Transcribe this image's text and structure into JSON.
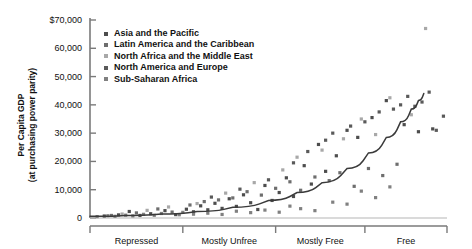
{
  "chart_data": {
    "type": "scatter",
    "title": "",
    "xlabel": "",
    "ylabel": "Per Capita GDP (at purchasing power parity)",
    "ylabel_line1": "Per Capita GDP",
    "ylabel_line2": "(at purchasing power parity)",
    "ylim": [
      0,
      70000
    ],
    "xlim": [
      0,
      100
    ],
    "grid": false,
    "legend_position": "top-left-inside",
    "y_ticks": [
      0,
      10000,
      20000,
      30000,
      40000,
      50000,
      60000,
      70000
    ],
    "y_tick_labels": [
      "0",
      "10,000",
      "20,000",
      "30,000",
      "40,000",
      "50,000",
      "60,000",
      "$70,000"
    ],
    "x_categories": [
      "Repressed",
      "Mostly Unfree",
      "Mostly Free",
      "Free"
    ],
    "x_category_bounds": [
      [
        0,
        26
      ],
      [
        26,
        52
      ],
      [
        52,
        77
      ],
      [
        77,
        100
      ]
    ],
    "x_tick_positions": [
      0,
      26,
      52,
      77,
      100
    ],
    "colors": {
      "asia_pacific": "#4d4d4d",
      "latin_america": "#6e6e6e",
      "north_africa_middle_east": "#a8a8a8",
      "north_america_europe": "#5a5a5a",
      "sub_saharan_africa": "#808080",
      "trend_line": "#3a3a3a",
      "axis": "#7a7a7a",
      "text": "#111111"
    },
    "series": [
      {
        "name": "Asia and the Pacific",
        "color": "#4d4d4d",
        "points": [
          [
            4,
            700
          ],
          [
            8,
            1100
          ],
          [
            11,
            2300
          ],
          [
            14,
            900
          ],
          [
            17,
            1500
          ],
          [
            21,
            2600
          ],
          [
            24,
            1200
          ],
          [
            27,
            3100
          ],
          [
            29,
            2200
          ],
          [
            31,
            4300
          ],
          [
            33,
            2900
          ],
          [
            35,
            5200
          ],
          [
            37,
            3400
          ],
          [
            39,
            6800
          ],
          [
            41,
            4100
          ],
          [
            43,
            8200
          ],
          [
            45,
            5400
          ],
          [
            47,
            3000
          ],
          [
            49,
            11500
          ],
          [
            51,
            6200
          ],
          [
            53,
            9000
          ],
          [
            55,
            14200
          ],
          [
            57,
            7600
          ],
          [
            60,
            18500
          ],
          [
            62,
            12000
          ],
          [
            64,
            26000
          ],
          [
            66,
            16500
          ],
          [
            69,
            22000
          ],
          [
            72,
            31000
          ],
          [
            75,
            28500
          ],
          [
            79,
            35500
          ],
          [
            83,
            41500
          ],
          [
            88,
            33000
          ],
          [
            92,
            30500
          ],
          [
            96,
            31500
          ]
        ]
      },
      {
        "name": "Latin America and the Caribbean",
        "color": "#6e6e6e",
        "points": [
          [
            6,
            900
          ],
          [
            13,
            1800
          ],
          [
            19,
            3200
          ],
          [
            23,
            2100
          ],
          [
            28,
            4600
          ],
          [
            32,
            5800
          ],
          [
            36,
            6400
          ],
          [
            40,
            7100
          ],
          [
            44,
            9300
          ],
          [
            48,
            8100
          ],
          [
            52,
            10500
          ],
          [
            56,
            12800
          ],
          [
            59,
            9800
          ],
          [
            63,
            14500
          ],
          [
            67,
            13200
          ],
          [
            70,
            16000
          ],
          [
            74,
            11200
          ],
          [
            78,
            17500
          ],
          [
            82,
            15000
          ],
          [
            86,
            19000
          ]
        ]
      },
      {
        "name": "North Africa and the Middle East",
        "color": "#a8a8a8",
        "points": [
          [
            9,
            1400
          ],
          [
            16,
            2700
          ],
          [
            22,
            3900
          ],
          [
            30,
            5100
          ],
          [
            38,
            8800
          ],
          [
            46,
            12500
          ],
          [
            54,
            17000
          ],
          [
            58,
            21500
          ],
          [
            65,
            24000
          ],
          [
            71,
            28000
          ],
          [
            76,
            35000
          ],
          [
            80,
            29500
          ],
          [
            84,
            42500
          ],
          [
            90,
            36500
          ],
          [
            94,
            67000
          ]
        ]
      },
      {
        "name": "North America and Europe",
        "color": "#5a5a5a",
        "points": [
          [
            34,
            7400
          ],
          [
            42,
            10200
          ],
          [
            50,
            13500
          ],
          [
            57,
            19500
          ],
          [
            61,
            23500
          ],
          [
            66,
            27500
          ],
          [
            68,
            30000
          ],
          [
            73,
            32500
          ],
          [
            77,
            34000
          ],
          [
            81,
            37500
          ],
          [
            85,
            38500
          ],
          [
            87,
            40000
          ],
          [
            89,
            43000
          ],
          [
            91,
            39500
          ],
          [
            93,
            41000
          ],
          [
            95,
            44500
          ],
          [
            97,
            31000
          ],
          [
            99,
            36000
          ]
        ]
      },
      {
        "name": "Sub-Saharan Africa",
        "color": "#808080",
        "points": [
          [
            2,
            500
          ],
          [
            5,
            800
          ],
          [
            7,
            600
          ],
          [
            10,
            1000
          ],
          [
            12,
            750
          ],
          [
            15,
            1300
          ],
          [
            18,
            950
          ],
          [
            20,
            1600
          ],
          [
            25,
            1150
          ],
          [
            26,
            2000
          ],
          [
            29,
            1350
          ],
          [
            33,
            1700
          ],
          [
            37,
            1250
          ],
          [
            41,
            2400
          ],
          [
            45,
            1900
          ],
          [
            49,
            2800
          ],
          [
            53,
            2050
          ],
          [
            56,
            4200
          ],
          [
            59,
            3300
          ],
          [
            63,
            2600
          ],
          [
            68,
            5600
          ],
          [
            72,
            4900
          ],
          [
            76,
            9500
          ],
          [
            80,
            7200
          ],
          [
            84,
            11000
          ]
        ]
      }
    ],
    "trend_line": {
      "name": "exponential fit",
      "color": "#3a3a3a",
      "points": [
        [
          0,
          600
        ],
        [
          10,
          900
        ],
        [
          20,
          1400
        ],
        [
          30,
          2300
        ],
        [
          40,
          3800
        ],
        [
          50,
          6200
        ],
        [
          58,
          9000
        ],
        [
          65,
          12500
        ],
        [
          72,
          17500
        ],
        [
          78,
          23000
        ],
        [
          83,
          28500
        ],
        [
          87,
          34000
        ],
        [
          90,
          38500
        ],
        [
          92,
          41500
        ],
        [
          93.5,
          44000
        ]
      ]
    },
    "legend": [
      {
        "label": "Asia and the Pacific",
        "color": "#4d4d4d"
      },
      {
        "label": "Latin America and the Caribbean",
        "color": "#6e6e6e"
      },
      {
        "label": "North Africa and the Middle East",
        "color": "#a8a8a8"
      },
      {
        "label": "North America and Europe",
        "color": "#5a5a5a"
      },
      {
        "label": "Sub-Saharan Africa",
        "color": "#808080"
      }
    ]
  }
}
